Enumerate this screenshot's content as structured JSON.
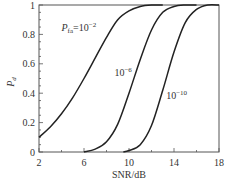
{
  "chart_data": {
    "type": "line",
    "title": "",
    "xlabel": "SNR/dB",
    "ylabel": "P_d",
    "xlim": [
      2,
      18
    ],
    "ylim": [
      0,
      1
    ],
    "xticks": [
      2,
      6,
      10,
      14,
      18
    ],
    "xtick_labels": [
      "2",
      "6",
      "10",
      "14",
      "18"
    ],
    "yticks": [
      0,
      0.2,
      0.4,
      0.6,
      0.8,
      1
    ],
    "ytick_labels": [
      "0",
      "0.2",
      "0.4",
      "0.6",
      "0.8",
      "1"
    ],
    "grid": false,
    "legend": "inline annotations",
    "series": [
      {
        "name": "P_fa=10^-2",
        "label": "P_fa=10^-2",
        "x": [
          2,
          3,
          4,
          5,
          6,
          7,
          8,
          9,
          10,
          11,
          12,
          13
        ],
        "values": [
          0.1,
          0.17,
          0.26,
          0.37,
          0.5,
          0.64,
          0.78,
          0.9,
          0.96,
          0.99,
          1.0,
          1.0
        ]
      },
      {
        "name": "P_fa=10^-6",
        "label": "10^-6",
        "x": [
          6,
          7,
          8,
          9,
          10,
          11,
          12,
          13,
          14,
          15,
          16
        ],
        "values": [
          0.0,
          0.02,
          0.07,
          0.19,
          0.4,
          0.63,
          0.83,
          0.95,
          0.99,
          1.0,
          1.0
        ]
      },
      {
        "name": "P_fa=10^-10",
        "label": "10^-10",
        "x": [
          9.5,
          10,
          11,
          12,
          13,
          14,
          15,
          16,
          17,
          18
        ],
        "values": [
          0.0,
          0.01,
          0.05,
          0.18,
          0.42,
          0.68,
          0.88,
          0.97,
          1.0,
          1.0
        ]
      }
    ],
    "annotations": [
      {
        "text_main": "P",
        "text_sub": "fa",
        "text_eq": "=10",
        "text_sup": "−2",
        "x": 4.0,
        "y": 0.82
      },
      {
        "text_main": "10",
        "text_sup": "−6",
        "x": 8.7,
        "y": 0.52
      },
      {
        "text_main": "10",
        "text_sup": "−10",
        "x": 13.3,
        "y": 0.36
      }
    ]
  },
  "axis": {
    "x_title": "SNR/dB",
    "y_title_main": "P",
    "y_title_sub": "d"
  }
}
